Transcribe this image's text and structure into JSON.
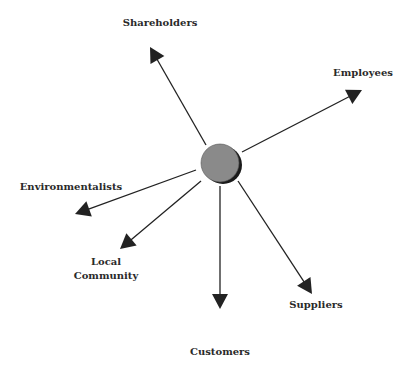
{
  "diagram": {
    "type": "hub-and-spoke",
    "center": {
      "x": 220,
      "y": 163,
      "r": 19,
      "fill": "#8a8a8a",
      "shadow": "#1a1a1a"
    },
    "arrow_color": "#222222",
    "stakeholders": [
      {
        "id": "shareholders",
        "label": "Shareholders",
        "line2": "",
        "from": [
          206,
          145
        ],
        "tip": [
          150,
          47
        ],
        "label_x": 160,
        "label_y": 16
      },
      {
        "id": "employees",
        "label": "Employees",
        "line2": "",
        "from": [
          242,
          152
        ],
        "tip": [
          362,
          90
        ],
        "label_x": 363,
        "label_y": 66
      },
      {
        "id": "environmentalists",
        "label": "Environmentalists",
        "line2": "",
        "from": [
          196,
          170
        ],
        "tip": [
          75,
          214
        ],
        "label_x": 71,
        "label_y": 180
      },
      {
        "id": "local-community",
        "label": "Local",
        "line2": "Community",
        "from": [
          201,
          181
        ],
        "tip": [
          120,
          249
        ],
        "label_x": 106,
        "label_y": 255
      },
      {
        "id": "customers",
        "label": "Customers",
        "line2": "",
        "from": [
          220,
          186
        ],
        "tip": [
          220,
          309
        ],
        "label_x": 220,
        "label_y": 345
      },
      {
        "id": "suppliers",
        "label": "Suppliers",
        "line2": "",
        "from": [
          238,
          181
        ],
        "tip": [
          312,
          294
        ],
        "label_x": 316,
        "label_y": 298
      }
    ]
  }
}
